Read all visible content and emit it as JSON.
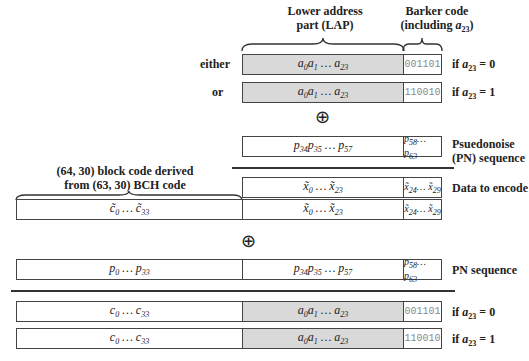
{
  "headers": {
    "lap": "Lower address\npart (LAP)",
    "barker": "Barker code\n(including a23)"
  },
  "top_rows": [
    {
      "prefix": "either",
      "lap": "a0a1 … a23",
      "barker": "001101",
      "condition": "if a23 = 0"
    },
    {
      "prefix": "or",
      "lap": "a0a1 … a23",
      "barker": "110010",
      "condition": "if a23 = 1"
    }
  ],
  "xor_symbol": "⊕",
  "pn_partial": {
    "mid": "p34p35 … p57",
    "right": "p58… p63",
    "label": "Psuedonoise\n(PN) sequence"
  },
  "data_to_encode": {
    "mid": "x̃0 … x̃23",
    "right": "x̃24… x̃29",
    "label": "Data to encode"
  },
  "block_code_label": "(64, 30) block code derived\nfrom (63, 30) BCH code",
  "codeword_row": {
    "left": "c̃0 … c̃33",
    "mid": "x̃0 … x̃23",
    "right": "x̃24… x̃29"
  },
  "pn_full": {
    "left": "p0 … p33",
    "mid": "p34p35 … p57",
    "right": "p58… p63",
    "label": "PN sequence"
  },
  "bottom_rows": [
    {
      "left": "c0 … c33",
      "mid": "a0a1 … a23",
      "barker": "001101",
      "condition": "if a23 = 0"
    },
    {
      "left": "c0 … c33",
      "mid": "a0a1 … a23",
      "barker": "110010",
      "condition": "if a23 = 1"
    }
  ]
}
